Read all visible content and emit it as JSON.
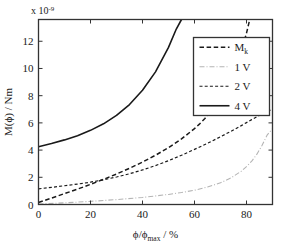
{
  "chart_data": {
    "type": "line",
    "title": "",
    "xlabel": "ϕ/ϕmax / %",
    "ylabel": "M(ϕ) / Nm",
    "y_exponent_label": "x 10",
    "y_exponent_value": "-9",
    "xlim": [
      0,
      90
    ],
    "ylim": [
      0,
      13.6
    ],
    "xticks": [
      0,
      20,
      40,
      60,
      80
    ],
    "xtick_labels": [
      "0",
      "20",
      "40",
      "60",
      "80"
    ],
    "yticks": [
      0,
      2,
      4,
      6,
      8,
      10,
      12
    ],
    "ytick_labels": [
      "0",
      "2",
      "4",
      "6",
      "8",
      "10",
      "12"
    ],
    "grid": false,
    "legend_position": "upper-right",
    "legend_entries": [
      "Mk",
      "1 V",
      "2 V",
      "4 V"
    ],
    "series": [
      {
        "name": "Mk",
        "label_main": "M",
        "label_sub": "k",
        "style": "dashed-thick",
        "color": "#1a1a1a",
        "x": [
          0,
          5,
          10,
          15,
          20,
          25,
          30,
          35,
          40,
          45,
          50,
          55,
          60,
          62,
          64,
          66,
          68,
          70,
          72,
          74,
          76,
          78,
          80,
          82,
          84,
          85,
          86
        ],
        "y": [
          0.15,
          0.47,
          0.8,
          1.13,
          1.48,
          1.85,
          2.24,
          2.66,
          3.12,
          3.62,
          4.18,
          4.82,
          5.58,
          5.93,
          6.32,
          6.76,
          7.26,
          7.83,
          8.5,
          9.29,
          10.2,
          11.3,
          12.6,
          14.2,
          16.0,
          17.0,
          18.0
        ]
      },
      {
        "name": "1 V",
        "label_main": "1 V",
        "style": "dash-dot-light",
        "color": "#b4b4b4",
        "x": [
          0,
          10,
          20,
          30,
          40,
          50,
          55,
          60,
          65,
          70,
          74,
          78,
          80,
          82,
          84,
          86,
          88,
          89,
          90
        ],
        "y": [
          0.04,
          0.12,
          0.23,
          0.36,
          0.52,
          0.74,
          0.88,
          1.05,
          1.28,
          1.6,
          1.95,
          2.45,
          2.78,
          3.18,
          3.7,
          4.35,
          5.12,
          5.35,
          5.55
        ]
      },
      {
        "name": "2 V",
        "label_main": "2 V",
        "style": "dashed-fine",
        "color": "#1a1a1a",
        "x": [
          0,
          5,
          10,
          15,
          20,
          25,
          30,
          35,
          40,
          45,
          50,
          55,
          60,
          65,
          70,
          74,
          78,
          80,
          82,
          84,
          86,
          88,
          90
        ],
        "y": [
          1.15,
          1.26,
          1.38,
          1.5,
          1.64,
          1.82,
          2.02,
          2.26,
          2.54,
          2.86,
          3.22,
          3.62,
          4.05,
          4.5,
          4.98,
          5.38,
          5.8,
          6.02,
          6.24,
          6.46,
          6.66,
          6.85,
          7.0
        ]
      },
      {
        "name": "4 V",
        "label_main": "4 V",
        "style": "solid",
        "color": "#1a1a1a",
        "x": [
          0,
          5,
          10,
          15,
          20,
          25,
          30,
          35,
          40,
          45,
          50,
          53,
          55
        ],
        "y": [
          4.25,
          4.48,
          4.75,
          5.06,
          5.45,
          5.93,
          6.55,
          7.35,
          8.4,
          9.75,
          11.55,
          12.9,
          13.6
        ]
      }
    ]
  }
}
